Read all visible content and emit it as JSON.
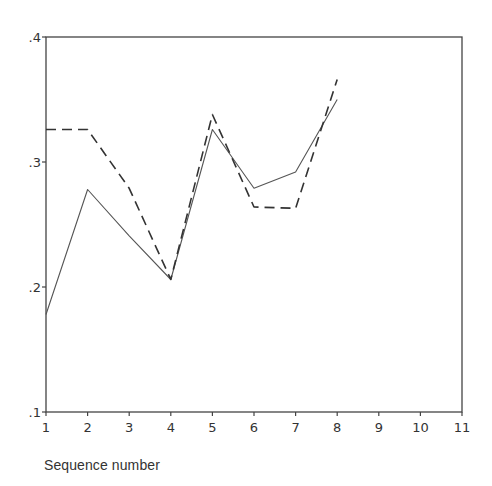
{
  "chart_data": {
    "type": "line",
    "title": "",
    "xlabel": "Sequence number",
    "ylabel": "",
    "x": [
      1,
      2,
      3,
      4,
      5,
      6,
      7,
      8
    ],
    "xlim": [
      1,
      11
    ],
    "ylim": [
      0.1,
      0.4
    ],
    "x_ticks": [
      "1",
      "2",
      "3",
      "4",
      "5",
      "6",
      "7",
      "8",
      "9",
      "10",
      "11"
    ],
    "y_ticks": [
      ".1",
      ".2",
      ".3",
      ".4"
    ],
    "y_tick_values": [
      0.1,
      0.2,
      0.3,
      0.4
    ],
    "grid": false,
    "legend": null,
    "frame": "box",
    "series": [
      {
        "name": "solid",
        "style": "solid",
        "color": "#555555",
        "values": [
          0.178,
          0.278,
          0.241,
          0.206,
          0.326,
          0.279,
          0.292,
          0.35
        ]
      },
      {
        "name": "dashed",
        "style": "dashed",
        "color": "#333333",
        "values": [
          0.326,
          0.326,
          0.279,
          0.206,
          0.338,
          0.264,
          0.263,
          0.366
        ]
      }
    ]
  },
  "layout": {
    "plot_left": 46,
    "plot_right": 462,
    "plot_top": 37,
    "plot_bottom": 412
  }
}
